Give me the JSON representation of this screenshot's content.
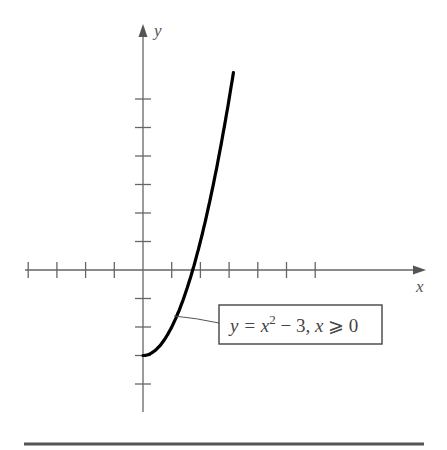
{
  "chart_data": {
    "type": "line",
    "title": "",
    "xlabel": "x",
    "ylabel": "y",
    "function": "y = x^2 - 3",
    "domain": "x >= 0",
    "x": [
      0,
      0.5,
      1,
      1.5,
      1.732,
      2,
      2.5,
      3,
      3.15
    ],
    "series": [
      {
        "name": "y = x^2 - 3, x >= 0",
        "values": [
          -3,
          -2.75,
          -2,
          -0.75,
          0,
          1,
          3.25,
          6,
          6.92
        ]
      }
    ],
    "xlim": [
      -4,
      9.8
    ],
    "ylim": [
      -5,
      8.6
    ],
    "x_ticks": [
      -4,
      -3,
      -2,
      -1,
      1,
      2,
      3,
      4,
      5,
      6
    ],
    "y_ticks": [
      -4,
      -3,
      -2,
      -1,
      1,
      2,
      3,
      4,
      5,
      6
    ],
    "grid": false,
    "legend_position": "callout box lower right",
    "annotation": {
      "label_y": "y",
      "eq": " = x",
      "sup": "2",
      "rest": " − 3, ",
      "label_x": "x",
      "cond": " ⩾ 0"
    },
    "colors": {
      "axis": "#666666",
      "curve": "#000000",
      "rule": "#555555"
    }
  },
  "axes": {
    "x_label": "x",
    "y_label": "y"
  }
}
